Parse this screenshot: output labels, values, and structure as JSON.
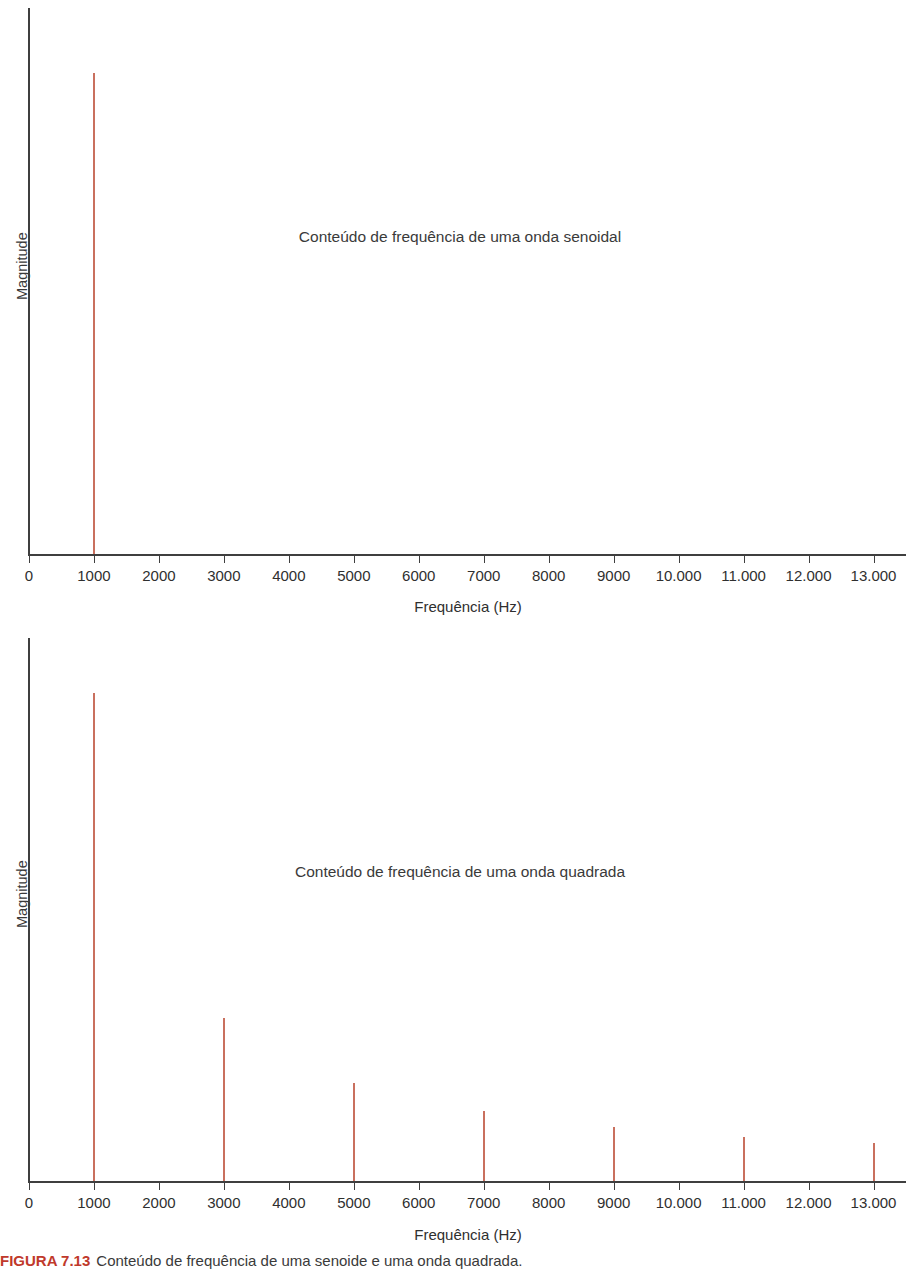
{
  "figure": {
    "caption_number": "FIGURA 7.13",
    "caption_text": "Conteúdo de frequência de uma senoide e uma onda quadrada."
  },
  "shared": {
    "xlabel": "Frequência (Hz)",
    "ylabel": "Magnitude",
    "spike_color": "#c9705e",
    "axis_color": "#3f3f3f",
    "tick_labels": [
      "0",
      "1000",
      "2000",
      "3000",
      "4000",
      "5000",
      "6000",
      "7000",
      "8000",
      "9000",
      "10.000",
      "11.000",
      "12.000",
      "13.000"
    ],
    "tick_values": [
      0,
      1000,
      2000,
      3000,
      4000,
      5000,
      6000,
      7000,
      8000,
      9000,
      10000,
      11000,
      12000,
      13000
    ]
  },
  "chart_data": [
    {
      "id": "sine-spectrum",
      "type": "bar",
      "title": "Conteúdo de frequência de uma onda senoidal",
      "xlabel": "Frequência (Hz)",
      "ylabel": "Magnitude",
      "xlim": [
        0,
        13500
      ],
      "ylim": [
        0,
        1.15
      ],
      "grid": false,
      "legend": "none",
      "categories": [
        1000
      ],
      "values": [
        1.0
      ],
      "x": [
        1000
      ],
      "y": [
        1.0
      ],
      "xticks": [
        0,
        1000,
        2000,
        3000,
        4000,
        5000,
        6000,
        7000,
        8000,
        9000,
        10000,
        11000,
        12000,
        13000
      ],
      "xticklabels": [
        "0",
        "1000",
        "2000",
        "3000",
        "4000",
        "5000",
        "6000",
        "7000",
        "8000",
        "9000",
        "10.000",
        "11.000",
        "12.000",
        "13.000"
      ],
      "yticks": [],
      "yticklabels": [],
      "annotations": [
        "Conteúdo de frequência de uma onda senoidal"
      ]
    },
    {
      "id": "square-spectrum",
      "type": "bar",
      "title": "Conteúdo de frequência de uma onda quadrada",
      "xlabel": "Frequência (Hz)",
      "ylabel": "Magnitude",
      "xlim": [
        0,
        13500
      ],
      "ylim": [
        0,
        1.15
      ],
      "grid": false,
      "legend": "none",
      "categories": [
        1000,
        3000,
        5000,
        7000,
        9000,
        11000,
        13000
      ],
      "values": [
        1.0,
        0.333,
        0.2,
        0.143,
        0.111,
        0.091,
        0.077
      ],
      "x": [
        1000,
        3000,
        5000,
        7000,
        9000,
        11000,
        13000
      ],
      "y": [
        1.0,
        0.333,
        0.2,
        0.143,
        0.111,
        0.091,
        0.077
      ],
      "xticks": [
        0,
        1000,
        2000,
        3000,
        4000,
        5000,
        6000,
        7000,
        8000,
        9000,
        10000,
        11000,
        12000,
        13000
      ],
      "xticklabels": [
        "0",
        "1000",
        "2000",
        "3000",
        "4000",
        "5000",
        "6000",
        "7000",
        "8000",
        "9000",
        "10.000",
        "11.000",
        "12.000",
        "13.000"
      ],
      "yticks": [],
      "yticklabels": [],
      "annotations": [
        "Conteúdo de frequência de uma onda quadrada"
      ]
    }
  ]
}
